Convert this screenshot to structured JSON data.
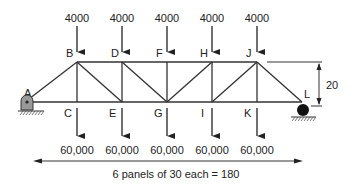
{
  "diagram": {
    "type": "truss",
    "nodes": {
      "top": [
        "B",
        "D",
        "F",
        "H",
        "J"
      ],
      "bottom": [
        "A",
        "C",
        "E",
        "G",
        "I",
        "K",
        "L"
      ]
    },
    "top_loads": [
      {
        "node": "B",
        "value": "4000"
      },
      {
        "node": "D",
        "value": "4000"
      },
      {
        "node": "F",
        "value": "4000"
      },
      {
        "node": "H",
        "value": "4000"
      },
      {
        "node": "J",
        "value": "4000"
      }
    ],
    "bottom_loads": [
      {
        "node": "C",
        "value": "60,000"
      },
      {
        "node": "E",
        "value": "60,000"
      },
      {
        "node": "G",
        "value": "60,000"
      },
      {
        "node": "I",
        "value": "60,000"
      },
      {
        "node": "K",
        "value": "60,000"
      }
    ],
    "height_label": "20",
    "span_label": "6 panels of 30 each = 180",
    "supports": {
      "left": "pin",
      "right": "roller"
    }
  }
}
